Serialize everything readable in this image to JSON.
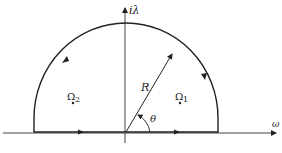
{
  "diagram": {
    "axes": {
      "vertical_label": "iλ",
      "horizontal_label": "ω"
    },
    "contour": {
      "radius_label": "R",
      "angle_label": "θ"
    },
    "points": [
      {
        "label": "Ω",
        "subscript": "2"
      },
      {
        "label": "Ω",
        "subscript": "1"
      }
    ],
    "colors": {
      "stroke": "#222222",
      "background": "#ffffff"
    }
  }
}
